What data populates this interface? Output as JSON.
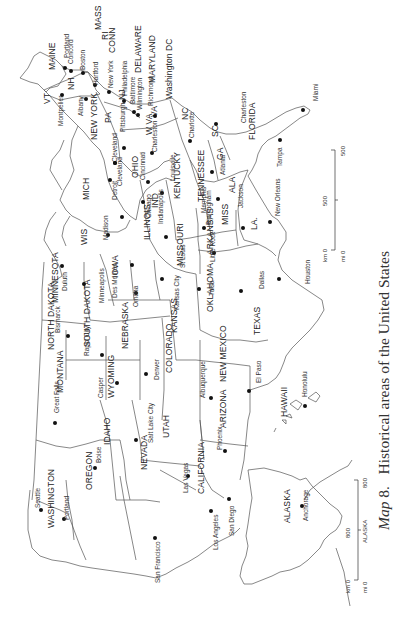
{
  "caption": {
    "map_prefix": "Map",
    "map_number": "8.",
    "title": "Historical areas of the United States"
  },
  "orientation": "rotated 90° counter-clockwise (north points left)",
  "states": [
    {
      "label": "MAINE",
      "x": 48,
      "y": 70
    },
    {
      "label": "VT",
      "x": 43,
      "y": 104
    },
    {
      "label": "NH",
      "x": 67,
      "y": 90
    },
    {
      "label": "MASS",
      "x": 94,
      "y": 30
    },
    {
      "label": "RI",
      "x": 101,
      "y": 40
    },
    {
      "label": "CONN",
      "x": 108,
      "y": 53
    },
    {
      "label": "NEW YORK",
      "x": 90,
      "y": 140
    },
    {
      "label": "NJ",
      "x": 118,
      "y": 100
    },
    {
      "label": "PA",
      "x": 104,
      "y": 123
    },
    {
      "label": "DELAWARE",
      "x": 134,
      "y": 73
    },
    {
      "label": "MARYLAND",
      "x": 148,
      "y": 83
    },
    {
      "label": "Washington DC",
      "x": 165,
      "y": 99
    },
    {
      "label": "W VA",
      "x": 145,
      "y": 135
    },
    {
      "label": "VA",
      "x": 150,
      "y": 117
    },
    {
      "label": "OHIO",
      "x": 131,
      "y": 178
    },
    {
      "label": "NC",
      "x": 181,
      "y": 120
    },
    {
      "label": "SC",
      "x": 211,
      "y": 137
    },
    {
      "label": "GA",
      "x": 216,
      "y": 160
    },
    {
      "label": "FLORIDA",
      "x": 248,
      "y": 140
    },
    {
      "label": "KENTUCKY",
      "x": 173,
      "y": 199
    },
    {
      "label": "TENNESSEE",
      "x": 197,
      "y": 202
    },
    {
      "label": "ALA",
      "x": 228,
      "y": 193
    },
    {
      "label": "MISS",
      "x": 221,
      "y": 225
    },
    {
      "label": "LA.",
      "x": 250,
      "y": 230
    },
    {
      "label": "MICH",
      "x": 82,
      "y": 200
    },
    {
      "label": "IND",
      "x": 151,
      "y": 208
    },
    {
      "label": "ILLINOIS",
      "x": 143,
      "y": 240
    },
    {
      "label": "WIS",
      "x": 80,
      "y": 245
    },
    {
      "label": "IOWA",
      "x": 111,
      "y": 278
    },
    {
      "label": "MISSOURI",
      "x": 176,
      "y": 266
    },
    {
      "label": "ARKANSAS",
      "x": 206,
      "y": 255
    },
    {
      "label": "MINNESOTA",
      "x": 51,
      "y": 303
    },
    {
      "label": "NORTH DAKOTA",
      "x": 47,
      "y": 350
    },
    {
      "label": "SOUTH DAKOTA",
      "x": 83,
      "y": 347
    },
    {
      "label": "NEBRASKA",
      "x": 121,
      "y": 349
    },
    {
      "label": "KANSAS",
      "x": 170,
      "y": 333
    },
    {
      "label": "OKLAHOMA",
      "x": 206,
      "y": 312
    },
    {
      "label": "TEXAS",
      "x": 253,
      "y": 335
    },
    {
      "label": "MONTANA",
      "x": 56,
      "y": 393
    },
    {
      "label": "WYOMING",
      "x": 107,
      "y": 398
    },
    {
      "label": "COLORADO",
      "x": 165,
      "y": 373
    },
    {
      "label": "NEW MEXICO",
      "x": 219,
      "y": 382
    },
    {
      "label": "IDAHO",
      "x": 103,
      "y": 445
    },
    {
      "label": "UTAH",
      "x": 162,
      "y": 438
    },
    {
      "label": "ARIZONA",
      "x": 219,
      "y": 428
    },
    {
      "label": "NEVADA",
      "x": 140,
      "y": 470
    },
    {
      "label": "CALIFORNIA",
      "x": 197,
      "y": 494
    },
    {
      "label": "OREGON",
      "x": 85,
      "y": 490
    },
    {
      "label": "WASHINGTON",
      "x": 47,
      "y": 528
    },
    {
      "label": "HAWAII",
      "x": 280,
      "y": 417
    },
    {
      "label": "ALASKA",
      "x": 283,
      "y": 523
    }
  ],
  "cities": [
    {
      "label": "Portland",
      "x": 64,
      "y": 58,
      "dx": 65,
      "dy": 68
    },
    {
      "label": "Concord",
      "x": 68,
      "y": 64,
      "dx": 71,
      "dy": 71
    },
    {
      "label": "Boston",
      "x": 80,
      "y": 70,
      "dx": 83,
      "dy": 73
    },
    {
      "label": "Hartford",
      "x": 93,
      "y": 85,
      "dx": 95,
      "dy": 85
    },
    {
      "label": "New York",
      "x": 108,
      "y": 88,
      "dx": 109,
      "dy": 92
    },
    {
      "label": "Albany",
      "x": 78,
      "y": 116,
      "dx": 86,
      "dy": 99
    },
    {
      "label": "Montpelier",
      "x": 58,
      "y": 126,
      "dx": 62,
      "dy": 95
    },
    {
      "label": "Philadelphia",
      "x": 122,
      "y": 96,
      "dx": 124,
      "dy": 101
    },
    {
      "label": "Baltimore",
      "x": 130,
      "y": 104,
      "dx": 134,
      "dy": 112
    },
    {
      "label": "Wilmington",
      "x": 137,
      "y": 110,
      "dx": 138,
      "dy": 115
    },
    {
      "label": "Richmond",
      "x": 148,
      "y": 106,
      "dx": 155,
      "dy": 116
    },
    {
      "label": "Pittsburgh",
      "x": 120,
      "y": 132,
      "dx": 124,
      "dy": 148
    },
    {
      "label": "Cleveland",
      "x": 112,
      "y": 162,
      "dx": 115,
      "dy": 163
    },
    {
      "label": "Cleveland",
      "x": 117,
      "y": 186,
      "dx": 115,
      "dy": 163
    },
    {
      "label": "Charleston",
      "x": 152,
      "y": 152,
      "dx": 152,
      "dy": 153
    },
    {
      "label": "Cincinnati",
      "x": 140,
      "y": 180,
      "dx": 148,
      "dy": 182
    },
    {
      "label": "Charlotte",
      "x": 189,
      "y": 138,
      "dx": 190,
      "dy": 141
    },
    {
      "label": "Charleston",
      "x": 241,
      "y": 123,
      "dx": 216,
      "dy": 124
    },
    {
      "label": "Atlanta",
      "x": 220,
      "y": 175,
      "dx": 212,
      "dy": 172
    },
    {
      "label": "Miami",
      "x": 313,
      "y": 101,
      "dx": 303,
      "dy": 110
    },
    {
      "label": "Tampa",
      "x": 277,
      "y": 167,
      "dx": 280,
      "dy": 140
    },
    {
      "label": "Detroit",
      "x": 112,
      "y": 200,
      "dx": 110,
      "dy": 180
    },
    {
      "label": "Louisville",
      "x": 170,
      "y": 181,
      "dx": 162,
      "dy": 193
    },
    {
      "label": "Indianapolis",
      "x": 158,
      "y": 224,
      "dx": 143,
      "dy": 202
    },
    {
      "label": "Chicago",
      "x": 146,
      "y": 218,
      "dx": 122,
      "dy": 217
    },
    {
      "label": "Madison",
      "x": 103,
      "y": 240,
      "dx": 108,
      "dy": 235
    },
    {
      "label": "Memphis",
      "x": 201,
      "y": 213,
      "dx": 204,
      "dy": 228
    },
    {
      "label": "Birmingham",
      "x": 206,
      "y": 225,
      "dx": 218,
      "dy": 199
    },
    {
      "label": "Jackson",
      "x": 238,
      "y": 208,
      "dx": 243,
      "dy": 228
    },
    {
      "label": "New Orleans",
      "x": 275,
      "y": 216,
      "dx": 270,
      "dy": 222
    },
    {
      "label": "Little Rock",
      "x": 210,
      "y": 262,
      "dx": 214,
      "dy": 253
    },
    {
      "label": "St Louis",
      "x": 180,
      "y": 268,
      "dx": 166,
      "dy": 237
    },
    {
      "label": "Duluth",
      "x": 62,
      "y": 291,
      "dx": 62,
      "dy": 266
    },
    {
      "label": "Minneapolis",
      "x": 99,
      "y": 303,
      "dx": 84,
      "dy": 284
    },
    {
      "label": "Des Moines",
      "x": 112,
      "y": 298,
      "dx": 132,
      "dy": 265
    },
    {
      "label": "Omaha",
      "x": 133,
      "y": 307,
      "dx": 136,
      "dy": 293
    },
    {
      "label": "Kansas City",
      "x": 174,
      "y": 310,
      "dx": 162,
      "dy": 279
    },
    {
      "label": "Tulsa",
      "x": 209,
      "y": 296,
      "dx": 199,
      "dy": 289
    },
    {
      "label": "Dallas",
      "x": 259,
      "y": 289,
      "dx": 241,
      "dy": 291
    },
    {
      "label": "Houston",
      "x": 305,
      "y": 284,
      "dx": 279,
      "dy": 279
    },
    {
      "label": "Bismarck",
      "x": 55,
      "y": 333,
      "dx": 68,
      "dy": 336
    },
    {
      "label": "Rapid City",
      "x": 84,
      "y": 356,
      "dx": 102,
      "dy": 355
    },
    {
      "label": "Denver",
      "x": 154,
      "y": 380,
      "dx": 146,
      "dy": 374
    },
    {
      "label": "Great Falls",
      "x": 54,
      "y": 413,
      "dx": 55,
      "dy": 423
    },
    {
      "label": "Casper",
      "x": 98,
      "y": 398,
      "dx": 117,
      "dy": 383
    },
    {
      "label": "Albuquerque",
      "x": 200,
      "y": 398,
      "dx": 211,
      "dy": 398
    },
    {
      "label": "El Paso",
      "x": 256,
      "y": 383,
      "dx": 249,
      "dy": 391
    },
    {
      "label": "Honolulu",
      "x": 302,
      "y": 397,
      "dx": 305,
      "dy": 406
    },
    {
      "label": "Salt Lake City",
      "x": 148,
      "y": 443,
      "dx": 136,
      "dy": 440
    },
    {
      "label": "Boise",
      "x": 96,
      "y": 463,
      "dx": 95,
      "dy": 468
    },
    {
      "label": "Phoenix",
      "x": 217,
      "y": 450,
      "dx": 225,
      "dy": 451
    },
    {
      "label": "Las Vegas",
      "x": 183,
      "y": 493,
      "dx": 188,
      "dy": 476
    },
    {
      "label": "Seattle",
      "x": 35,
      "y": 508,
      "dx": 41,
      "dy": 510
    },
    {
      "label": "Portland",
      "x": 64,
      "y": 520,
      "dx": 64,
      "dy": 519
    },
    {
      "label": "Los Angeles",
      "x": 213,
      "y": 550,
      "dx": 211,
      "dy": 511
    },
    {
      "label": "San Diego",
      "x": 229,
      "y": 536,
      "dx": 229,
      "dy": 499
    },
    {
      "label": "San Francisco",
      "x": 155,
      "y": 583,
      "dx": 155,
      "dy": 538
    },
    {
      "label": "Anchorage",
      "x": 303,
      "y": 521,
      "dx": 302,
      "dy": 506
    }
  ],
  "scale_bars": [
    {
      "name": "contiguous",
      "km_label": "km 0",
      "mi_label": "mi 0",
      "km_end": "500",
      "mi_end": "500",
      "mid": "500"
    },
    {
      "name": "alaska",
      "km_label": "km 0",
      "mi_label": "mi 0",
      "km_end": "800",
      "mi_end": "800",
      "mid": "800",
      "sub": "ALASKA"
    }
  ]
}
